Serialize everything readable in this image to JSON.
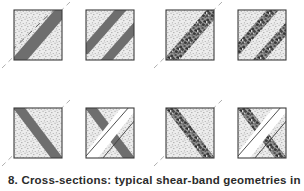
{
  "figure": {
    "caption": "8. Cross-sections: typical shear-band geometries in Block",
    "colors": {
      "band_solid": "#6e6e6e",
      "band_gravel_base": "#7a7a7a",
      "border": "#3c3c3c",
      "stipple_background": "#ececec",
      "stipple_dot": "#707070",
      "guide_line": "#9a9a9a",
      "gap_white": "#ffffff",
      "page_background": "#ffffff"
    },
    "layout": {
      "rows": 2,
      "columns": 4,
      "panel_width": 48,
      "panel_height": 50
    },
    "panels": [
      {
        "id": "panel-1",
        "row": 1,
        "column": 1,
        "x": 14,
        "y": 10,
        "fill_style": "solid-gray",
        "band_pattern": "single-band",
        "band_count": 1,
        "has_center_dashes": true,
        "has_cross_band": false,
        "has_corner_guide_line": true,
        "guide_line_style": "dashed-diagonal"
      },
      {
        "id": "panel-2",
        "row": 1,
        "column": 2,
        "x": 86,
        "y": 10,
        "fill_style": "solid-gray",
        "band_pattern": "double-band",
        "band_count": 2,
        "has_center_dashes": false,
        "has_cross_band": false,
        "has_corner_guide_line": false,
        "guide_line_style": "none"
      },
      {
        "id": "panel-3",
        "row": 1,
        "column": 3,
        "x": 166,
        "y": 10,
        "fill_style": "gravel-texture",
        "band_pattern": "single-band",
        "band_count": 1,
        "has_center_dashes": false,
        "has_cross_band": false,
        "has_corner_guide_line": true,
        "guide_line_style": "dashed-diagonal"
      },
      {
        "id": "panel-4",
        "row": 1,
        "column": 4,
        "x": 238,
        "y": 10,
        "fill_style": "gravel-texture",
        "band_pattern": "double-band",
        "band_count": 2,
        "has_center_dashes": false,
        "has_cross_band": false,
        "has_corner_guide_line": false,
        "guide_line_style": "none"
      },
      {
        "id": "panel-5",
        "row": 2,
        "column": 1,
        "x": 14,
        "y": 108,
        "fill_style": "solid-gray",
        "band_pattern": "single-band",
        "band_count": 1,
        "has_center_dashes": false,
        "has_cross_band": false,
        "has_corner_guide_line": true,
        "guide_line_style": "dashed-diagonal-crossing"
      },
      {
        "id": "panel-6",
        "row": 2,
        "column": 2,
        "x": 86,
        "y": 108,
        "fill_style": "solid-gray",
        "band_pattern": "crossed-bands",
        "band_count": 1,
        "has_center_dashes": false,
        "has_cross_band": true,
        "has_corner_guide_line": false,
        "guide_line_style": "none"
      },
      {
        "id": "panel-7",
        "row": 2,
        "column": 3,
        "x": 166,
        "y": 108,
        "fill_style": "gravel-texture",
        "band_pattern": "single-band",
        "band_count": 1,
        "has_center_dashes": false,
        "has_cross_band": false,
        "has_corner_guide_line": true,
        "guide_line_style": "dashed-diagonal-crossing"
      },
      {
        "id": "panel-8",
        "row": 2,
        "column": 4,
        "x": 238,
        "y": 108,
        "fill_style": "gravel-texture",
        "band_pattern": "crossed-bands",
        "band_count": 1,
        "has_center_dashes": false,
        "has_cross_band": true,
        "has_corner_guide_line": false,
        "guide_line_style": "none"
      }
    ]
  }
}
